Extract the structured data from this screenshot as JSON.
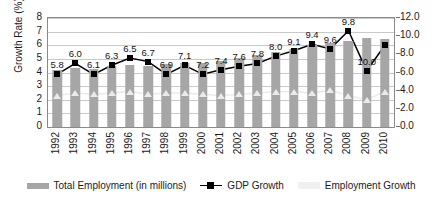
{
  "chart_data": {
    "type": "bar",
    "title": "",
    "subtitle": "",
    "xlabel": "",
    "ylabel": "Growth Rate (%)",
    "ylabel_secondary": "",
    "grid": true,
    "legend_position": "bottom",
    "categories": [
      "1992",
      "1993",
      "1994",
      "1995",
      "1996",
      "1997",
      "1998",
      "1999",
      "2000",
      "2001",
      "2002",
      "2003",
      "2004",
      "2005",
      "2006",
      "2007",
      "2008",
      "2009",
      "2010"
    ],
    "ylim": [
      0,
      8
    ],
    "yticks": [
      "0",
      "1",
      "2",
      "3",
      "4",
      "5",
      "6",
      "7",
      "8"
    ],
    "ylim_secondary": [
      0,
      12
    ],
    "yticks_secondary": [
      "0.0",
      "2.0",
      "4.0",
      "6.0",
      "8.0",
      "10.0",
      "12.0"
    ],
    "series": [
      {
        "name": "Total Employment (in millions)",
        "type": "bar",
        "axis": "secondary",
        "color": "#a6a6a6",
        "values": [
          6.3,
          6.5,
          6.4,
          6.7,
          6.8,
          6.7,
          6.9,
          7.0,
          7.0,
          7.3,
          7.6,
          7.9,
          8.3,
          8.6,
          9.0,
          9.2,
          9.5,
          9.8,
          9.7
        ]
      },
      {
        "name": "GDP Growth",
        "type": "line",
        "axis": "secondary",
        "color": "#000000",
        "values": [
          5.8,
          7.0,
          5.8,
          6.8,
          7.6,
          7.2,
          5.8,
          6.8,
          5.8,
          6.3,
          6.7,
          7.0,
          7.8,
          8.4,
          9.1,
          8.6,
          10.6,
          6.2,
          9.0
        ],
        "data_labels": [
          "5.8",
          "6.0",
          "6.1",
          "6.3",
          "6.5",
          "6.7",
          "6.9",
          "7.1",
          "7.2",
          "7.4",
          "7.6",
          "7.8",
          "8.0",
          "9.1",
          "9.4",
          "9.6",
          "9.8",
          "10.0",
          ""
        ]
      },
      {
        "name": "Employment Growth",
        "type": "line",
        "axis": "primary",
        "color": "#eaeaea",
        "values": [
          2.3,
          2.5,
          2.4,
          2.5,
          2.6,
          2.4,
          2.5,
          2.5,
          2.4,
          2.3,
          2.4,
          2.5,
          2.6,
          2.6,
          2.5,
          2.7,
          2.3,
          2.0,
          2.6
        ]
      }
    ],
    "legend": [
      {
        "label": "Total Employment (in millions)",
        "marker": "bar-swatch",
        "color": "#a6a6a6"
      },
      {
        "label": "GDP Growth",
        "marker": "line-square-marker",
        "color": "#000000"
      },
      {
        "label": "Employment Growth",
        "marker": "faint-swatch",
        "color": "#f0f0f0"
      }
    ]
  }
}
